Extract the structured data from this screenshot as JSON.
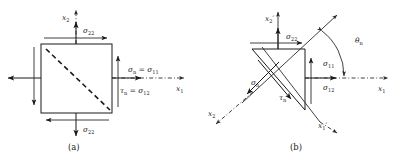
{
  "figure": {
    "panels": [
      {
        "id": "a",
        "caption": "(a)",
        "description": "Axis-aligned square stress element with dashed diagonal cut plane",
        "axes": [
          {
            "name": "x2-axis",
            "label": "x",
            "sub": "2",
            "prime": ""
          },
          {
            "name": "x1-axis",
            "label": "x",
            "sub": "1",
            "prime": ""
          }
        ],
        "stress_labels": [
          {
            "name": "sigma-22-top",
            "symbol": "σ",
            "sub": "22"
          },
          {
            "name": "sigma-22-bottom",
            "symbol": "σ",
            "sub": "22"
          },
          {
            "name": "sigma-n-equation",
            "lhs_symbol": "σ",
            "lhs_sub": "n",
            "eq": "=",
            "rhs_symbol": "σ",
            "rhs_sub": "11"
          },
          {
            "name": "tau-n-equation",
            "lhs_symbol": "τ",
            "lhs_sub": "n",
            "eq": "=",
            "rhs_symbol": "σ",
            "rhs_sub": "12"
          }
        ]
      },
      {
        "id": "b",
        "caption": "(b)",
        "description": "Rotated triangular wedge element with rotated axes and traction components",
        "axes": [
          {
            "name": "x2-prime-axis",
            "label": "x",
            "sub": "2",
            "prime": "′"
          },
          {
            "name": "x1-axis",
            "label": "x",
            "sub": "1",
            "prime": ""
          },
          {
            "name": "x2-axis",
            "label": "x",
            "sub": "2",
            "prime": ""
          },
          {
            "name": "x1-prime-axis",
            "label": "x",
            "sub": "1",
            "prime": "′"
          }
        ],
        "angle": {
          "name": "theta-n",
          "symbol": "θ",
          "sub": "n"
        },
        "stress_labels": [
          {
            "name": "sigma-22",
            "symbol": "σ",
            "sub": "22"
          },
          {
            "name": "sigma-11",
            "symbol": "σ",
            "sub": "11"
          },
          {
            "name": "sigma-12",
            "symbol": "σ",
            "sub": "12"
          },
          {
            "name": "sigma-n",
            "symbol": "σ",
            "sub": "n"
          },
          {
            "name": "tau-n",
            "symbol": "τ",
            "sub": "n"
          }
        ]
      }
    ],
    "colors": {
      "background": "#ffffff",
      "ink": "#1a1a1a",
      "thin_ink": "#2b2b2b"
    }
  },
  "labels": {
    "a": {
      "x2": {
        "sym": "x",
        "sub": "2"
      },
      "x1": {
        "sym": "x",
        "sub": "1"
      },
      "sigma22_top": {
        "sym": "σ",
        "sub": "22"
      },
      "sigma22_bottom": {
        "sym": "σ",
        "sub": "22"
      },
      "sigma_n": {
        "sym": "σ",
        "sub": "n"
      },
      "sigma_11": {
        "sym": "σ",
        "sub": "11"
      },
      "tau_n": {
        "sym": "τ",
        "sub": "n"
      },
      "sigma_12": {
        "sym": "σ",
        "sub": "12"
      },
      "eq1": "=",
      "eq2": "=",
      "caption": "(a)"
    },
    "b": {
      "x2p": {
        "sym": "x",
        "sub": "2",
        "pr": "′"
      },
      "x1": {
        "sym": "x",
        "sub": "1"
      },
      "x2": {
        "sym": "x",
        "sub": "2"
      },
      "x1p": {
        "sym": "x",
        "sub": "1",
        "pr": "′"
      },
      "theta_n": {
        "sym": "θ",
        "sub": "n"
      },
      "sigma22": {
        "sym": "σ",
        "sub": "22"
      },
      "sigma11": {
        "sym": "σ",
        "sub": "11"
      },
      "sigma12": {
        "sym": "σ",
        "sub": "12"
      },
      "sigma_n": {
        "sym": "σ",
        "sub": "n"
      },
      "tau_n": {
        "sym": "τ",
        "sub": "n"
      },
      "caption": "(b)"
    }
  }
}
